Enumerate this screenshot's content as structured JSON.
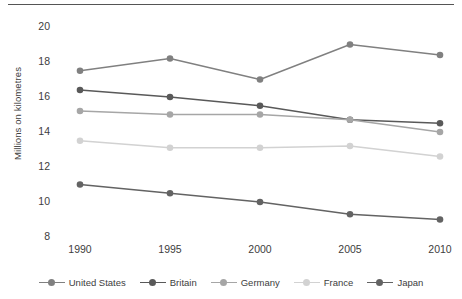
{
  "chart_data": {
    "type": "line",
    "title": "",
    "xlabel": "",
    "ylabel": "Millions on kilometres",
    "categories": [
      "1990",
      "1995",
      "2000",
      "2005",
      "2010"
    ],
    "ylim": [
      8,
      20
    ],
    "yticks": [
      "8",
      "10",
      "12",
      "14",
      "16",
      "18",
      "20"
    ],
    "grid": false,
    "legend_position": "bottom",
    "series": [
      {
        "name": "United States",
        "color": "#808080",
        "values": [
          17.5,
          18.2,
          17.0,
          19.0,
          18.4
        ]
      },
      {
        "name": "Britain",
        "color": "#595959",
        "values": [
          16.4,
          16.0,
          15.5,
          14.7,
          14.5
        ]
      },
      {
        "name": "Germany",
        "color": "#a6a6a6",
        "values": [
          15.2,
          15.0,
          15.0,
          14.7,
          14.0
        ]
      },
      {
        "name": "France",
        "color": "#d2d2d2",
        "values": [
          13.5,
          13.1,
          13.1,
          13.2,
          12.6
        ]
      },
      {
        "name": "Japan",
        "color": "#636363",
        "values": [
          11.0,
          10.5,
          10.0,
          9.3,
          9.0
        ]
      }
    ]
  }
}
